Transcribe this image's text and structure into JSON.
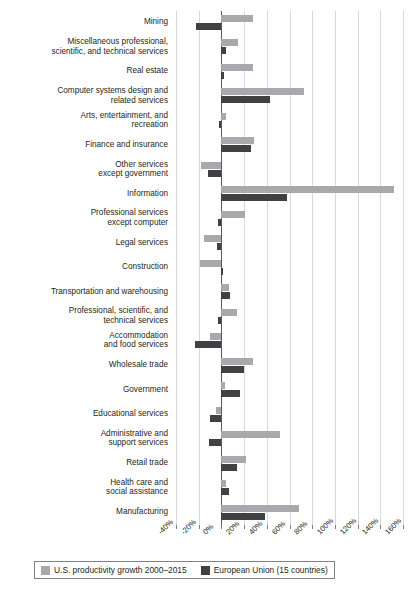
{
  "chart_data": {
    "type": "bar",
    "orientation": "horizontal",
    "title": "",
    "subtitle": "",
    "xlabel": "",
    "ylabel": "",
    "xlim": [
      -40,
      160
    ],
    "xtick_labels": [
      "-40%",
      "-20%",
      "0%",
      "20%",
      "40%",
      "60%",
      "80%",
      "100%",
      "120%",
      "140%",
      "160%"
    ],
    "xticks": [
      -40,
      -20,
      0,
      20,
      40,
      60,
      80,
      100,
      120,
      140,
      160
    ],
    "grid": true,
    "legend_position": "bottom-left",
    "categories": [
      "Mining",
      "Miscellaneous professional, scientific, and technical services",
      "Real estate",
      "Computer systems design and related services",
      "Arts, entertainment, and recreation",
      "Finance and insurance",
      "Other services except government",
      "Information",
      "Professional services except computer",
      "Legal services",
      "Construction",
      "Transportation and warehousing",
      "Professional, scientific, and technical services",
      "Accommodation and food services",
      "Wholesale trade",
      "Government",
      "Educational services",
      "Administrative and support services",
      "Retail trade",
      "Health care and social assistance",
      "Manufacturing"
    ],
    "category_lines": [
      [
        "Mining"
      ],
      [
        "Miscellaneous professional,",
        "scientific, and technical services"
      ],
      [
        "Real estate"
      ],
      [
        "Computer systems design and",
        "related services"
      ],
      [
        "Arts, entertainment, and",
        "recreation"
      ],
      [
        "Finance and insurance"
      ],
      [
        "Other services",
        "except government"
      ],
      [
        "Information"
      ],
      [
        "Professional services",
        "except computer"
      ],
      [
        "Legal services"
      ],
      [
        "Construction"
      ],
      [
        "Transportation and warehousing"
      ],
      [
        "Professional, scientific, and",
        "technical services"
      ],
      [
        "Accommodation",
        "and food services"
      ],
      [
        "Wholesale trade"
      ],
      [
        "Government"
      ],
      [
        "Educational services"
      ],
      [
        "Administrative and",
        "support services"
      ],
      [
        "Retail trade"
      ],
      [
        "Health care and",
        "social assistance"
      ],
      [
        "Manufacturing"
      ]
    ],
    "series": [
      {
        "name": "U.S. productivity growth 2000–2015",
        "key": "us",
        "color": "#a7a9ac",
        "values": [
          28,
          15,
          28,
          73,
          4,
          29,
          -18,
          152,
          21,
          -15,
          -19,
          7,
          14,
          -10,
          28,
          3,
          -5,
          52,
          22,
          4,
          68
        ]
      },
      {
        "name": "European Union (15 countries)",
        "key": "eu",
        "color": "#414042",
        "values": [
          -22,
          4,
          2,
          43,
          -2,
          26,
          -12,
          58,
          -3,
          -4,
          1,
          8,
          -3,
          -23,
          20,
          16,
          -10,
          -11,
          14,
          7,
          38
        ]
      }
    ]
  },
  "legend": {
    "items": [
      {
        "label": "U.S. productivity growth 2000–2015",
        "color": "#a7a9ac"
      },
      {
        "label": "European Union (15 countries)",
        "color": "#414042"
      }
    ]
  },
  "colors": {
    "us_bar": "#a7a9ac",
    "eu_bar": "#414042",
    "gridline": "#d9d9d9",
    "zero_axis": "#58595b",
    "text": "#231f20",
    "background": "#ffffff"
  }
}
